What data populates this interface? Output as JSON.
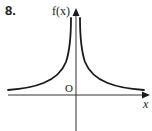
{
  "problem": {
    "number": "8."
  },
  "graph": {
    "y_axis_label": "f(x)",
    "x_axis_label": "x",
    "origin_label": "O",
    "description": "Graph of a function symmetric about the y-axis, with a vertical asymptote at x = 0 and horizontal asymptote y = 0 (x-axis); both branches lie above the x-axis, rising toward infinity near the y-axis.",
    "colors": {
      "curve": "#1a1a1a",
      "axes": "#333333",
      "background": "#ffffff"
    }
  }
}
